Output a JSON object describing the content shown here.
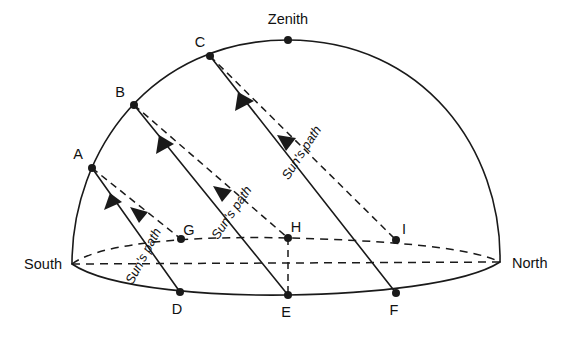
{
  "diagram": {
    "background_color": "#ffffff",
    "line_color": "#1a1a1a",
    "cardinals": {
      "south": "South",
      "north": "North",
      "zenith": "Zenith"
    },
    "points": [
      {
        "id": "A",
        "label": "A",
        "x": 92,
        "y": 168,
        "label_x": 78,
        "label_y": 159
      },
      {
        "id": "B",
        "label": "B",
        "x": 134,
        "y": 105,
        "label_x": 120,
        "label_y": 97
      },
      {
        "id": "C",
        "label": "C",
        "x": 210,
        "y": 56,
        "label_x": 200,
        "label_y": 47
      },
      {
        "id": "D",
        "label": "D",
        "x": 180,
        "y": 292,
        "label_x": 175,
        "label_y": 312
      },
      {
        "id": "E",
        "label": "E",
        "x": 288,
        "y": 295,
        "label_x": 283,
        "label_y": 315
      },
      {
        "id": "F",
        "label": "F",
        "x": 396,
        "y": 293,
        "label_x": 391,
        "label_y": 313
      },
      {
        "id": "G",
        "label": "G",
        "x": 181,
        "y": 239,
        "label_x": 187,
        "label_y": 233
      },
      {
        "id": "H",
        "label": "H",
        "x": 288,
        "y": 238,
        "label_x": 294,
        "label_y": 231
      },
      {
        "id": "I",
        "label": "I",
        "x": 396,
        "y": 240,
        "label_x": 402,
        "label_y": 233
      },
      {
        "id": "Z",
        "label": "Zenith",
        "x": 288,
        "y": 40,
        "label_x": 288,
        "label_y": 21
      }
    ],
    "sun_paths": [
      {
        "id": "path-A-D",
        "label": "Sun's path",
        "from": "D",
        "to": "A",
        "label_x": 147,
        "label_y": 258,
        "rotation": -62
      },
      {
        "id": "path-B-E",
        "label": "Sun's path",
        "from": "E",
        "to": "B",
        "label_x": 235,
        "label_y": 215,
        "rotation": -56
      },
      {
        "id": "path-C-F",
        "label": "Sun's path",
        "from": "F",
        "to": "C",
        "label_x": 305,
        "label_y": 155,
        "rotation": -57
      }
    ],
    "dashed_paths": [
      {
        "id": "dash-A-G",
        "from": "A",
        "to": "G"
      },
      {
        "id": "dash-B-H",
        "from": "B",
        "to": "H"
      },
      {
        "id": "dash-C-I",
        "from": "C",
        "to": "I"
      }
    ],
    "horizon": {
      "label": "horizon-ellipse",
      "south_x": 72,
      "south_y": 264,
      "north_x": 500,
      "north_y": 262
    }
  }
}
